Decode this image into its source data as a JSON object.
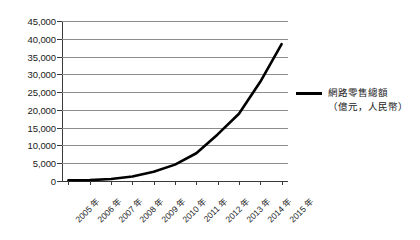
{
  "chart_data": {
    "type": "line",
    "title": "",
    "subtitle": "",
    "xlabel": "",
    "ylabel": "",
    "categories": [
      "2005 年",
      "2006 年",
      "2007 年",
      "2008 年",
      "2009 年",
      "2010 年",
      "2011 年",
      "2012 年",
      "2013 年",
      "2014 年",
      "2015 年"
    ],
    "x": [
      2005,
      2006,
      2007,
      2008,
      2009,
      2010,
      2011,
      2012,
      2013,
      2014,
      2015
    ],
    "series": [
      {
        "name": "網路零售總額（億元，人民幣）",
        "values": [
          190,
          260,
          560,
          1280,
          2600,
          4610,
          7800,
          13100,
          18900,
          27900,
          38500
        ],
        "color": "#000000"
      }
    ],
    "ylim": [
      0,
      45000
    ],
    "yticks": [
      0,
      5000,
      10000,
      15000,
      20000,
      25000,
      30000,
      35000,
      40000,
      45000
    ],
    "ytick_labels": [
      "0",
      "5,000",
      "10,000",
      "15,000",
      "20,000",
      "25,000",
      "30,000",
      "35,000",
      "40,000",
      "45,000"
    ],
    "grid": true,
    "grid_axis": "y",
    "legend_position": "right"
  },
  "legend": {
    "entries": [
      {
        "line1": "網路零售總額",
        "line2": "（億元，人民幣）",
        "color": "#000000"
      }
    ]
  },
  "colors": {
    "series_line": "#000000",
    "gridline": "#8d8d8d",
    "axis": "#3a3a3a",
    "text": "#1a1a1a",
    "background": "#ffffff"
  }
}
